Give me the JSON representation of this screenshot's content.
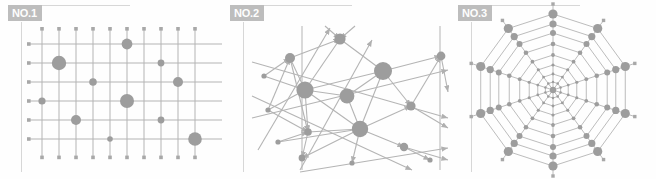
{
  "figure": {
    "background_color": "#fefefe",
    "node_color": "#9d9d9d",
    "edge_color": "#b4b4b4",
    "rule_color": "#d7d7d7",
    "label_bg_color": "#bdbdbd",
    "label_text_color": "#fdfdfd"
  },
  "panels": [
    {
      "id": "panel-1",
      "label": "NO.1",
      "topology": "grid-lattice-network",
      "x": 0,
      "width": 222
    },
    {
      "id": "panel-2",
      "label": "NO.2",
      "topology": "random-scale-free-network",
      "x": 222,
      "width": 228
    },
    {
      "id": "panel-3",
      "label": "NO.3",
      "topology": "radial-spider-web-network",
      "x": 450,
      "width": 206
    }
  ],
  "chart_data": {
    "type": "scatter",
    "title": "",
    "xlabel": "",
    "ylabel": "",
    "subplots": [
      {
        "name": "NO.1",
        "type": "grid-lattice-network",
        "description": "Regular rectangular lattice: 10 vertical lines crossed by 6 horizontal lines; selected intersections carry weighted circular nodes of varying radius.",
        "grid": {
          "vertical_lines": 10,
          "horizontal_lines": 6,
          "v_x": [
            42,
            59,
            76,
            93,
            110,
            127,
            144,
            161,
            178,
            195
          ],
          "h_y": [
            44,
            63,
            82,
            101,
            120,
            139
          ],
          "x_min": 42,
          "x_max": 195,
          "y_min": 44,
          "y_max": 139
        },
        "nodes": [
          {
            "col": 5,
            "row": 0,
            "x": 127,
            "y": 44,
            "r": 5.4
          },
          {
            "col": 1,
            "row": 1,
            "x": 59,
            "y": 63,
            "r": 7.2
          },
          {
            "col": 7,
            "row": 1,
            "x": 161,
            "y": 63,
            "r": 3.4
          },
          {
            "col": 3,
            "row": 2,
            "x": 93,
            "y": 82,
            "r": 3.8
          },
          {
            "col": 8,
            "row": 2,
            "x": 178,
            "y": 82,
            "r": 5.0
          },
          {
            "col": 0,
            "row": 3,
            "x": 42,
            "y": 101,
            "r": 3.6
          },
          {
            "col": 5,
            "row": 3,
            "x": 127,
            "y": 101,
            "r": 7.0
          },
          {
            "col": 2,
            "row": 4,
            "x": 76,
            "y": 120,
            "r": 5.0
          },
          {
            "col": 7,
            "row": 4,
            "x": 161,
            "y": 120,
            "r": 3.4
          },
          {
            "col": 4,
            "row": 5,
            "x": 110,
            "y": 139,
            "r": 2.8
          },
          {
            "col": 9,
            "row": 5,
            "x": 195,
            "y": 139,
            "r": 6.8
          }
        ]
      },
      {
        "name": "NO.2",
        "type": "random-scale-free-network",
        "description": "Irregular directed network: 16 nodes with heterogeneous degree and radius, connected by straight arrow-tipped edges that cross freely.",
        "nodes": [
          {
            "id": 0,
            "x": 340,
            "y": 39,
            "r": 5.6
          },
          {
            "id": 1,
            "x": 290,
            "y": 58,
            "r": 5.0
          },
          {
            "id": 2,
            "x": 305,
            "y": 90,
            "r": 8.6
          },
          {
            "id": 3,
            "x": 308,
            "y": 132,
            "r": 3.8
          },
          {
            "id": 4,
            "x": 302,
            "y": 158,
            "r": 3.4
          },
          {
            "id": 5,
            "x": 347,
            "y": 96,
            "r": 7.4
          },
          {
            "id": 6,
            "x": 360,
            "y": 129,
            "r": 8.2
          },
          {
            "id": 7,
            "x": 383,
            "y": 71,
            "r": 9.0
          },
          {
            "id": 8,
            "x": 411,
            "y": 106,
            "r": 4.6
          },
          {
            "id": 9,
            "x": 404,
            "y": 147,
            "r": 4.2
          },
          {
            "id": 10,
            "x": 441,
            "y": 56,
            "r": 4.4
          },
          {
            "id": 11,
            "x": 268,
            "y": 110,
            "r": 2.6
          },
          {
            "id": 12,
            "x": 264,
            "y": 76,
            "r": 2.6
          },
          {
            "id": 13,
            "x": 352,
            "y": 163,
            "r": 2.6
          },
          {
            "id": 14,
            "x": 430,
            "y": 160,
            "r": 2.6
          },
          {
            "id": 15,
            "x": 278,
            "y": 142,
            "r": 2.6
          }
        ],
        "edge_count": 34,
        "directed": true
      },
      {
        "name": "NO.3",
        "type": "radial-spider-web-network",
        "description": "Concentric spider-web: 10 radial spokes emanating from a hub crossed by 8 concentric decagonal rings; the outermost ring carries the largest nodes.",
        "center": {
          "x": 553,
          "y": 90
        },
        "spokes": 10,
        "rings": 8,
        "ring_radii": [
          8,
          16,
          25,
          35,
          46,
          57,
          66,
          76
        ],
        "ring_node_radii": [
          1.2,
          1.4,
          1.6,
          1.9,
          2.3,
          3.0,
          3.6,
          4.6
        ],
        "spoke_angles_deg": [
          0,
          36,
          72,
          108,
          144,
          180,
          216,
          252,
          288,
          324
        ]
      }
    ]
  }
}
